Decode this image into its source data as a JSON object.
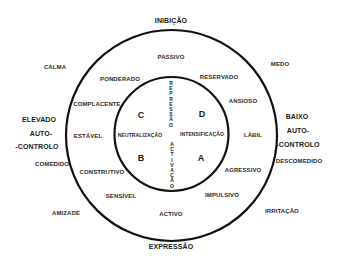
{
  "diagram": {
    "axes": {
      "top": "INIBIÇÃO",
      "bottom": "EXPRESSÃO",
      "left": [
        "ELEVADO",
        "AUTO-",
        "-CONTROLO"
      ],
      "right": [
        "BAIXO",
        "AUTO-",
        "-CONTROLO"
      ]
    },
    "outside_labels": {
      "calma": "CALMA",
      "medo": "MEDO",
      "comedido": "COMEDIDO",
      "descomedido": "DESCOMEDIDO",
      "amizade": "AMIZADE",
      "irritacao": "IRRITAÇÃO"
    },
    "outer_ring_labels": {
      "passivo": "PASSIVO",
      "ponderado": "PONDERADO",
      "reservado": "RESERVADO",
      "complacente": "COMPLACENTE",
      "ansioso": "ANSIOSO",
      "estavel": "ESTÁVEL",
      "labil": "LÁBIL",
      "construtivo": "CONSTRUTIVO",
      "agressivo": "AGRESSIVO",
      "sensivel": "SENSÍVEL",
      "impulsivo": "IMPULSIVO",
      "activo": "ACTIVO"
    },
    "inner_circle": {
      "quadrants": {
        "c": "C",
        "d": "D",
        "b": "B",
        "a": "A"
      },
      "left": "NEUTRALIZAÇÃO",
      "right": "INTENSIFICAÇÃO",
      "top_vertical": [
        "R",
        "E",
        "P",
        "R",
        "E",
        "S",
        "S",
        "Ã",
        "O"
      ],
      "bottom_vertical": [
        "A",
        "C",
        "T",
        "I",
        "V",
        "A",
        "Ç",
        "Ã",
        "O"
      ]
    },
    "colors": {
      "line": "#111111",
      "text": "#222222",
      "background": "#ffffff"
    }
  }
}
